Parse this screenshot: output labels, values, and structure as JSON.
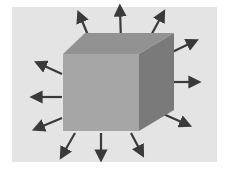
{
  "diagram": {
    "title": "Cube with outward-radiating arrows",
    "colors": {
      "page_bg": "#ffffff",
      "panel_bg": "#e4e4e4",
      "front_face": "#a6a6a6",
      "top_face": "#929292",
      "right_face": "#7a7a7a",
      "arrow": "#3a3a3a"
    },
    "panel": {
      "x": 12,
      "y": 7,
      "w": 205,
      "h": 155
    },
    "cube": {
      "front": "63,54 139,54 139,131 63,131",
      "top": "63,54 85,33 174,33 139,54",
      "right": "139,54 174,33 174,110 139,131"
    },
    "arrows": [
      {
        "x1": 90,
        "y1": 40,
        "x2": 80,
        "y2": 16
      },
      {
        "x1": 121,
        "y1": 41,
        "x2": 120,
        "y2": 10
      },
      {
        "x1": 148,
        "y1": 41,
        "x2": 162,
        "y2": 15
      },
      {
        "x1": 166,
        "y1": 55,
        "x2": 193,
        "y2": 42
      },
      {
        "x1": 163,
        "y1": 82,
        "x2": 195,
        "y2": 82
      },
      {
        "x1": 161,
        "y1": 113,
        "x2": 186,
        "y2": 124
      },
      {
        "x1": 131,
        "y1": 133,
        "x2": 141,
        "y2": 152
      },
      {
        "x1": 101,
        "y1": 133,
        "x2": 101,
        "y2": 156
      },
      {
        "x1": 75,
        "y1": 133,
        "x2": 63,
        "y2": 154
      },
      {
        "x1": 62,
        "y1": 118,
        "x2": 38,
        "y2": 128
      },
      {
        "x1": 62,
        "y1": 97,
        "x2": 36,
        "y2": 97
      },
      {
        "x1": 62,
        "y1": 74,
        "x2": 40,
        "y2": 64
      }
    ]
  }
}
